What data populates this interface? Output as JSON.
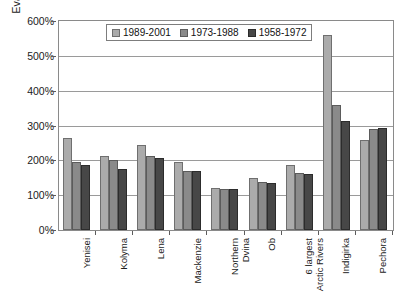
{
  "chart_data": {
    "type": "bar",
    "title": "",
    "xlabel": "",
    "ylabel": "Evaporation ratio",
    "ylim": [
      0,
      600
    ],
    "ytick_labels": [
      "600%",
      "500%",
      "400%",
      "300%",
      "200%",
      "100%",
      "0%"
    ],
    "ytick_values": [
      600,
      500,
      400,
      300,
      200,
      100,
      0
    ],
    "grid": "horizontal",
    "legend_position": "top-center",
    "categories": [
      "Yenisei",
      "Kolyma",
      "Lena",
      "Mackenzie",
      "Northern\nDvina",
      "Ob",
      "6 largest\nArctic Rivers",
      "Indigirka",
      "Pechora"
    ],
    "series": [
      {
        "name": "1989-2001",
        "color": "#ababab",
        "values": [
          265,
          213,
          243,
          196,
          122,
          150,
          186,
          560,
          257
        ]
      },
      {
        "name": "1973-1988",
        "color": "#8a8a8a",
        "values": [
          195,
          200,
          212,
          170,
          117,
          137,
          165,
          358,
          290
        ]
      },
      {
        "name": "1958-1972",
        "color": "#474747",
        "values": [
          188,
          176,
          208,
          170,
          117,
          135,
          160,
          313,
          292
        ]
      }
    ]
  }
}
